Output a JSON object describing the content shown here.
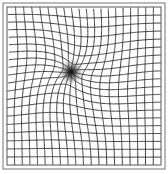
{
  "figure": {
    "type": "amsler-grid",
    "grid": {
      "columns": 20,
      "rows": 20,
      "x0": 7,
      "y0": 7,
      "x1": 161,
      "y1": 165,
      "line_color": "#2a2a2a",
      "line_width": 0.9
    },
    "frame": {
      "x": 3,
      "y": 3,
      "width": 162,
      "height": 166,
      "color": "#777777",
      "inner_color": "#555555"
    },
    "distortion": {
      "center_x": 71,
      "center_y": 72,
      "strength": 11,
      "radius": 32
    },
    "scotoma": {
      "center_x": 71,
      "center_y": 72,
      "radius": 13,
      "color": "#1a1a1a"
    }
  }
}
